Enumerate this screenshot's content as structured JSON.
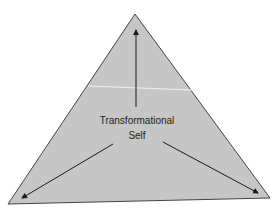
{
  "diagram": {
    "type": "triangle-with-arrows",
    "center_label_line1": "Transformational",
    "center_label_line2": "Self",
    "colors": {
      "fill": "#c6c6c6",
      "stroke": "#444444",
      "arrow": "#1a1a1a",
      "artifact_line": "#f2f2f2"
    },
    "arrows": [
      {
        "direction": "up",
        "to": "apex"
      },
      {
        "direction": "down-left",
        "to": "bottom-left-vertex"
      },
      {
        "direction": "down-right",
        "to": "bottom-right-vertex"
      }
    ]
  }
}
